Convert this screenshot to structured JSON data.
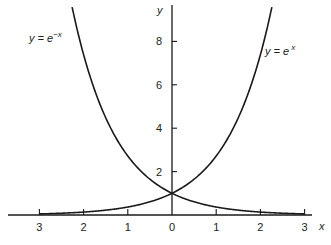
{
  "chart_data": {
    "type": "line",
    "title": "",
    "xlabel": "x",
    "ylabel": "y",
    "xlim": [
      -3,
      3
    ],
    "ylim": [
      0,
      9
    ],
    "x_tick_labels": [
      "3",
      "2",
      "1",
      "0",
      "1",
      "2",
      "3"
    ],
    "x_ticks": [
      -3,
      -2,
      -1,
      0,
      1,
      2,
      3
    ],
    "y_tick_labels": [
      "2",
      "4",
      "6",
      "8"
    ],
    "y_ticks": [
      2,
      4,
      6,
      8
    ],
    "grid": false,
    "legend": "inline annotations",
    "series": [
      {
        "name": "y = e^-x",
        "label_base": "y = e",
        "label_exp": "−x",
        "x": [
          -3,
          -2,
          -1,
          0,
          1,
          2,
          3
        ],
        "values": [
          20.09,
          7.39,
          2.72,
          1,
          0.37,
          0.14,
          0.05
        ]
      },
      {
        "name": "y = e^x",
        "label_base": "y = e",
        "label_exp": "x",
        "x": [
          -3,
          -2,
          -1,
          0,
          1,
          2,
          3
        ],
        "values": [
          0.05,
          0.14,
          0.37,
          1,
          2.72,
          7.39,
          20.09
        ]
      }
    ],
    "annotations": [
      "y = e^-x",
      "y = e^x"
    ],
    "colors": {
      "curve": "#1a1a1a",
      "axis": "#1a1a1a",
      "text": "#222222"
    }
  }
}
